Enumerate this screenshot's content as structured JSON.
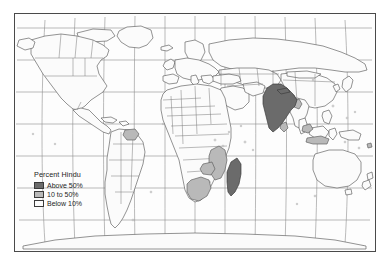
{
  "figure": {
    "kind": "thematic-world-map",
    "projection": "robinson",
    "frame_color": "#4a4a4a",
    "background_color": "#ffffff",
    "map_fill_color": "#fdfdfd"
  },
  "legend": {
    "title": "Percent Hindu",
    "items": [
      {
        "label": "Above 50%",
        "color": "#6b6b6b",
        "range_min": 50,
        "range_max": 100
      },
      {
        "label": "10 to 50%",
        "color": "#b9b9b9",
        "range_min": 10,
        "range_max": 50
      },
      {
        "label": "Below 10%",
        "color": "#fbfbfb",
        "range_min": 0,
        "range_max": 10
      }
    ]
  },
  "map": {
    "graticule": {
      "visible": true,
      "color": "#8d8d8d",
      "meridian_spacing_deg": 30,
      "parallel_spacing_deg": 30
    },
    "coastline_color": "#5a5a5a",
    "country_border_color": "#777777",
    "classes": {
      "above_50": "#6b6b6b",
      "ten_to_50": "#b9b9b9",
      "below_10": "#fbfbfb"
    },
    "highlighted_regions": [
      {
        "name": "India",
        "class": "above_50"
      },
      {
        "name": "Nepal",
        "class": "above_50"
      },
      {
        "name": "Madagascar",
        "class": "above_50"
      },
      {
        "name": "Bangladesh",
        "class": "ten_to_50"
      },
      {
        "name": "Sri Lanka",
        "class": "ten_to_50"
      },
      {
        "name": "Bhutan",
        "class": "ten_to_50"
      },
      {
        "name": "Mozambique",
        "class": "ten_to_50"
      },
      {
        "name": "Zimbabwe",
        "class": "ten_to_50"
      },
      {
        "name": "South Africa",
        "class": "ten_to_50"
      },
      {
        "name": "Guyana",
        "class": "ten_to_50"
      },
      {
        "name": "Suriname",
        "class": "ten_to_50"
      },
      {
        "name": "Malaysia",
        "class": "ten_to_50"
      },
      {
        "name": "Indonesia",
        "class": "ten_to_50"
      }
    ]
  }
}
